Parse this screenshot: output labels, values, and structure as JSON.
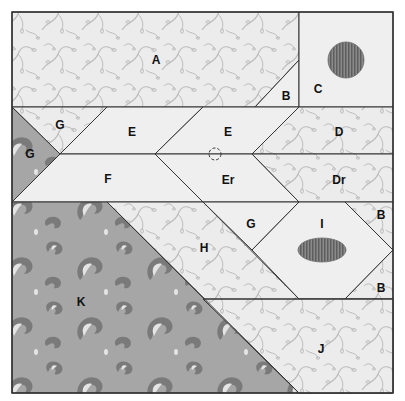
{
  "diagram": {
    "type": "quilt-block-pattern",
    "colors": {
      "background": "#ffffff",
      "light_print": "#ebebeb",
      "light_print_motif": "#bdbdbd",
      "solid_light": "#efefef",
      "paisley_base": "#a6a6a6",
      "paisley_motif_dark": "#7a7a7a",
      "paisley_motif_light": "#e6e6e6",
      "seam_line": "#333333",
      "applique": "#6e6e6e"
    },
    "pieces": [
      {
        "id": "A",
        "label": "A",
        "fabric": "light-print"
      },
      {
        "id": "B1",
        "label": "B",
        "fabric": "solid-light"
      },
      {
        "id": "C",
        "label": "C",
        "fabric": "solid-light",
        "applique": "circle"
      },
      {
        "id": "G1",
        "label": "G",
        "fabric": "light-print"
      },
      {
        "id": "G2",
        "label": "G",
        "fabric": "paisley"
      },
      {
        "id": "E1",
        "label": "E",
        "fabric": "solid-light"
      },
      {
        "id": "E2",
        "label": "E",
        "fabric": "solid-light"
      },
      {
        "id": "D",
        "label": "D",
        "fabric": "light-print"
      },
      {
        "id": "F",
        "label": "F",
        "fabric": "solid-light"
      },
      {
        "id": "Er",
        "label": "Er",
        "fabric": "solid-light"
      },
      {
        "id": "Dr",
        "label": "Dr",
        "fabric": "light-print"
      },
      {
        "id": "G3",
        "label": "G",
        "fabric": "solid-light"
      },
      {
        "id": "H",
        "label": "H",
        "fabric": "light-print"
      },
      {
        "id": "I",
        "label": "I",
        "fabric": "solid-light",
        "applique": "oval"
      },
      {
        "id": "B2",
        "label": "B",
        "fabric": "light-print"
      },
      {
        "id": "B3",
        "label": "B",
        "fabric": "light-print"
      },
      {
        "id": "K",
        "label": "K",
        "fabric": "paisley"
      },
      {
        "id": "J",
        "label": "J",
        "fabric": "light-print"
      }
    ],
    "labels": {
      "A": "A",
      "B_top": "B",
      "C": "C",
      "G_upper": "G",
      "G_left": "G",
      "E_left": "E",
      "E_right": "E",
      "D": "D",
      "F": "F",
      "Er": "Er",
      "Dr": "Dr",
      "G_mid": "G",
      "H": "H",
      "I": "I",
      "B_right_top": "B",
      "B_right_bottom": "B",
      "K": "K",
      "J": "J"
    },
    "markers": {
      "dashed_circle": "registration-mark"
    }
  }
}
